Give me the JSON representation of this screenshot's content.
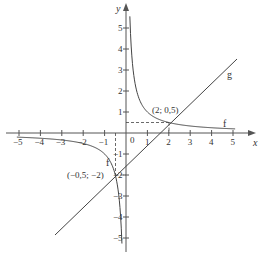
{
  "chart_data": {
    "type": "line",
    "title": "",
    "xlabel": "x",
    "ylabel": "y",
    "xlim": [
      -5.5,
      5.5
    ],
    "ylim": [
      -5.5,
      5.8
    ],
    "grid": false,
    "x_ticks": [
      -5,
      -4,
      -3,
      -2,
      -1,
      1,
      2,
      3,
      4,
      5
    ],
    "x_tick_labels": [
      "-5",
      "-4",
      "-3",
      "-2",
      "-1",
      "1",
      "2",
      "3",
      "4",
      "5"
    ],
    "y_ticks": [
      -5,
      -4,
      -3,
      -2,
      -1,
      1,
      2,
      3,
      4,
      5
    ],
    "y_tick_labels": [
      "-5",
      "-4",
      "-3",
      "-2",
      "-1",
      "1",
      "2",
      "3",
      "4",
      "5"
    ],
    "origin_label": "0",
    "series": [
      {
        "name": "f",
        "description": "hyperbola f(x) = 1/x",
        "points_right_branch": [
          [
            0.18,
            5.5
          ],
          [
            0.25,
            4
          ],
          [
            0.5,
            2
          ],
          [
            1,
            1
          ],
          [
            2,
            0.5
          ],
          [
            3,
            0.333
          ],
          [
            4,
            0.25
          ],
          [
            5,
            0.2
          ]
        ],
        "points_left_branch": [
          [
            -5,
            -0.2
          ],
          [
            -4,
            -0.25
          ],
          [
            -3,
            -0.333
          ],
          [
            -2,
            -0.5
          ],
          [
            -1,
            -1
          ],
          [
            -0.5,
            -2
          ],
          [
            -0.25,
            -4
          ],
          [
            -0.2,
            -5
          ]
        ]
      },
      {
        "name": "g",
        "description": "straight line through (2; 0,5) and (-0,5; -2)",
        "points": [
          [
            -3.3,
            -4.8
          ],
          [
            5.1,
            3.6
          ]
        ]
      }
    ],
    "annotations": [
      {
        "text": "(2; 0,5)",
        "x": 2,
        "y": 0.5
      },
      {
        "text": "(−0,5; −2)",
        "x": -0.5,
        "y": -2
      },
      {
        "text": "f",
        "near": "right branch of f"
      },
      {
        "text": "f",
        "near": "left branch of f"
      },
      {
        "text": "g",
        "near": "line g"
      }
    ],
    "guides": [
      {
        "type": "dashed",
        "from": [
          0,
          0.5
        ],
        "to": [
          2,
          0.5
        ]
      },
      {
        "type": "dashed",
        "from": [
          2,
          0.5
        ],
        "to": [
          2,
          0
        ]
      },
      {
        "type": "dashed",
        "from": [
          -0.5,
          0
        ],
        "to": [
          -0.5,
          -2
        ]
      },
      {
        "type": "dashed",
        "from": [
          -0.5,
          -2
        ],
        "to": [
          0,
          -2
        ]
      }
    ]
  },
  "labels": {
    "x_axis": "x",
    "y_axis": "y",
    "origin": "0",
    "curve_f_right": "f",
    "curve_f_left": "f",
    "line_g": "g",
    "point_a": "(2; 0,5)",
    "point_b": "(−0,5; −2)"
  },
  "x_ticks": [
    {
      "v": -5,
      "label": "−5"
    },
    {
      "v": -4,
      "label": "−4"
    },
    {
      "v": -3,
      "label": "−3"
    },
    {
      "v": -2,
      "label": "−2"
    },
    {
      "v": -1,
      "label": "−1"
    },
    {
      "v": 1,
      "label": "1"
    },
    {
      "v": 2,
      "label": "2"
    },
    {
      "v": 3,
      "label": "3"
    },
    {
      "v": 4,
      "label": "4"
    },
    {
      "v": 5,
      "label": "5"
    }
  ],
  "y_ticks": [
    {
      "v": 5,
      "label": "5"
    },
    {
      "v": 4,
      "label": "4"
    },
    {
      "v": 3,
      "label": "3"
    },
    {
      "v": 2,
      "label": "2"
    },
    {
      "v": 1,
      "label": "1"
    },
    {
      "v": -1,
      "label": "−1"
    },
    {
      "v": -2,
      "label": "−2"
    },
    {
      "v": -3,
      "label": "−3"
    },
    {
      "v": -4,
      "label": "−4"
    },
    {
      "v": -5,
      "label": "−5"
    }
  ],
  "colors": {
    "axis": "#555555",
    "curve": "#444444",
    "text": "#333333"
  }
}
